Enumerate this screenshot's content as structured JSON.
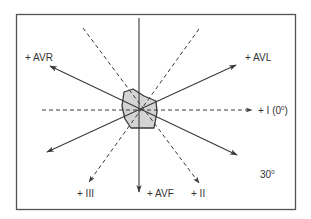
{
  "diagram": {
    "center": {
      "x": 139,
      "y": 110
    },
    "colors": {
      "stroke": "#3a3a3a",
      "frame": "#555555",
      "heart_fill": "#d4d4d4",
      "text": "#333333"
    },
    "leads": [
      {
        "name": "I",
        "label": "+ I (0",
        "sup": "0",
        "suffix": ")",
        "angle_deg": 0,
        "style": "dashed"
      },
      {
        "name": "II",
        "label": "+  II",
        "angle_deg": 60,
        "style": "dashed"
      },
      {
        "name": "III",
        "label": "+  III",
        "angle_deg": 120,
        "style": "dashed"
      },
      {
        "name": "aVR",
        "label": "+  AVR",
        "angle_deg": -150,
        "style": "solid"
      },
      {
        "name": "aVL",
        "label": "+  AVL",
        "angle_deg": -30,
        "style": "solid"
      },
      {
        "name": "aVF",
        "label": "+ AVF",
        "angle_deg": 90,
        "style": "solid"
      }
    ],
    "spacing_note": {
      "text": "30",
      "sup": "0"
    }
  }
}
